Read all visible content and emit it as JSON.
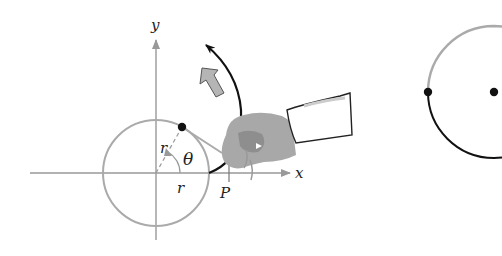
{
  "diagram": {
    "left_figure": {
      "axes": {
        "x_label": "x",
        "y_label": "y"
      },
      "labels": {
        "radius_1": "r",
        "radius_2": "r",
        "angle": "θ",
        "point": "P"
      },
      "description": "Circle of radius r centered at origin with string unwound by a hand, tracing an involute curve starting at P"
    },
    "right_figure": {
      "description": "Circle with gray upper arc and black lower arc, dot at center and dot at leftmost point"
    },
    "colors": {
      "axis": "#999999",
      "circle": "#aaaaaa",
      "curve": "#111111",
      "hand": "#a8a8a8",
      "arrow_fill": "#b5b5b5"
    }
  }
}
